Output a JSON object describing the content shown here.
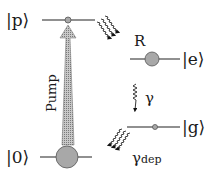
{
  "diagram": {
    "type": "energy-level-scheme",
    "levels": [
      {
        "id": "p",
        "label": "|p⟩"
      },
      {
        "id": "e",
        "label": "|e⟩"
      },
      {
        "id": "g",
        "label": "|g⟩"
      },
      {
        "id": "0",
        "label": "|0⟩"
      }
    ],
    "transitions": [
      {
        "from": "0",
        "to": "p",
        "label": "Pump",
        "style": "shaded-arrow"
      },
      {
        "from": "p",
        "to": "e",
        "label": "R",
        "style": "wavy-decay"
      },
      {
        "from": "e",
        "to": "g",
        "label": "γ",
        "style": "wavy-decay"
      },
      {
        "from": "g",
        "to": "0",
        "label": "γ",
        "sub": "dep",
        "style": "wavy-decay"
      }
    ],
    "colors": {
      "line": "#222222",
      "circle_fill": "#a8a8a8",
      "circle_stroke": "#555555",
      "pump_fill": "#b0b0b0"
    }
  }
}
